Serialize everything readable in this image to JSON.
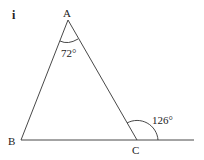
{
  "part_label": "i",
  "vertices": {
    "A": {
      "label": "A",
      "x": 68,
      "y": 20
    },
    "B": {
      "label": "B",
      "x": 21,
      "y": 140
    },
    "C": {
      "label": "C",
      "x": 137,
      "y": 140
    }
  },
  "extension_end": {
    "x": 194,
    "y": 140
  },
  "angles": {
    "A": {
      "value": "72°"
    },
    "exterior_C": {
      "value": "126°"
    }
  },
  "colors": {
    "line": "#333333",
    "text": "#222222"
  }
}
